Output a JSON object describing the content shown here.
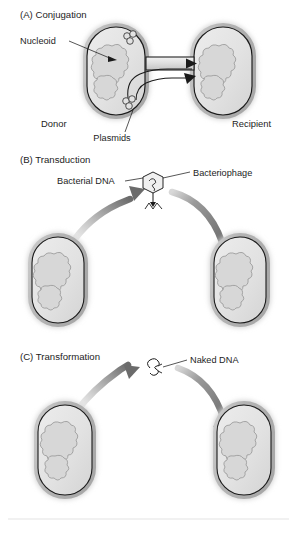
{
  "figure": {
    "background_color": "#ffffff",
    "panels": [
      {
        "id": "conjugation",
        "heading": "(A) Conjugation",
        "labels": {
          "nucleoid": "Nucleoid",
          "plasmids": "Plasmids",
          "donor": "Donor",
          "recipient": "Recipient"
        }
      },
      {
        "id": "transduction",
        "heading": "(B) Transduction",
        "labels": {
          "bacterial_dna": "Bacterial DNA",
          "bacteriophage": "Bacteriophage"
        }
      },
      {
        "id": "transformation",
        "heading": "(C) Transformation",
        "labels": {
          "naked_dna": "Naked DNA"
        }
      }
    ],
    "caption": "",
    "colors": {
      "cell_envelope": "#b8b8b8",
      "cell_halo": "#d8d8d8",
      "cytoplasm": "#e0e0e0",
      "nucleoid_fill": "#d5d5d5",
      "nucleoid_stroke": "#8c8c8c",
      "membrane_stroke": "#1a1a1a",
      "arrow_dark": "#6e6e6e",
      "arrow_light": "#f4f4f4",
      "text": "#1d1d1d",
      "rule": "#e4e4e4"
    },
    "icons": {
      "plasmid": "plasmid-circles-icon",
      "phage": "bacteriophage-icon",
      "naked_dna": "naked-dna-strand-icon"
    }
  }
}
